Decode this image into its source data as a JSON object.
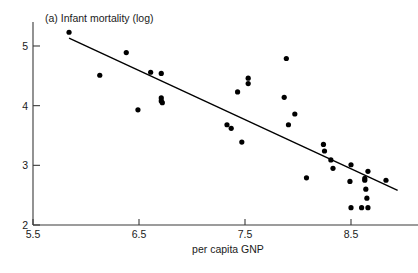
{
  "chart_data": {
    "type": "scatter",
    "title": "(a) Infant mortality (log)",
    "xlabel": "per capita GNP",
    "ylabel": "",
    "xlim": [
      5.5,
      8.86
    ],
    "ylim": [
      2,
      5.4
    ],
    "grid": false,
    "legend": "none",
    "xticks": [
      "5.5",
      "6.5",
      "7.5",
      "8.5"
    ],
    "xtick_values": [
      5.5,
      6.5,
      7.5,
      8.5
    ],
    "yticks": [
      "2",
      "3",
      "4",
      "5"
    ],
    "ytick_values": [
      2,
      3,
      4,
      5
    ],
    "points": [
      {
        "x": 5.84,
        "y": 5.23
      },
      {
        "x": 6.13,
        "y": 4.51
      },
      {
        "x": 6.38,
        "y": 4.89
      },
      {
        "x": 6.49,
        "y": 3.93
      },
      {
        "x": 6.61,
        "y": 4.56
      },
      {
        "x": 6.71,
        "y": 4.54
      },
      {
        "x": 6.71,
        "y": 4.13
      },
      {
        "x": 6.71,
        "y": 4.08
      },
      {
        "x": 6.72,
        "y": 4.05
      },
      {
        "x": 7.33,
        "y": 3.68
      },
      {
        "x": 7.37,
        "y": 3.62
      },
      {
        "x": 7.43,
        "y": 4.23
      },
      {
        "x": 7.47,
        "y": 3.39
      },
      {
        "x": 7.53,
        "y": 4.46
      },
      {
        "x": 7.53,
        "y": 4.37
      },
      {
        "x": 7.87,
        "y": 4.14
      },
      {
        "x": 7.89,
        "y": 4.79
      },
      {
        "x": 7.91,
        "y": 3.68
      },
      {
        "x": 7.97,
        "y": 3.86
      },
      {
        "x": 8.08,
        "y": 2.79
      },
      {
        "x": 8.24,
        "y": 3.35
      },
      {
        "x": 8.25,
        "y": 3.24
      },
      {
        "x": 8.31,
        "y": 3.09
      },
      {
        "x": 8.33,
        "y": 2.95
      },
      {
        "x": 8.49,
        "y": 2.73
      },
      {
        "x": 8.5,
        "y": 2.29
      },
      {
        "x": 8.5,
        "y": 3.01
      },
      {
        "x": 8.6,
        "y": 2.29
      },
      {
        "x": 8.63,
        "y": 2.78
      },
      {
        "x": 8.63,
        "y": 2.75
      },
      {
        "x": 8.64,
        "y": 2.6
      },
      {
        "x": 8.65,
        "y": 2.45
      },
      {
        "x": 8.66,
        "y": 2.29
      },
      {
        "x": 8.66,
        "y": 2.9
      },
      {
        "x": 8.83,
        "y": 2.75
      }
    ],
    "fit_line": {
      "x0": 5.84,
      "y0": 5.13,
      "x1": 8.94,
      "y1": 2.58
    }
  }
}
